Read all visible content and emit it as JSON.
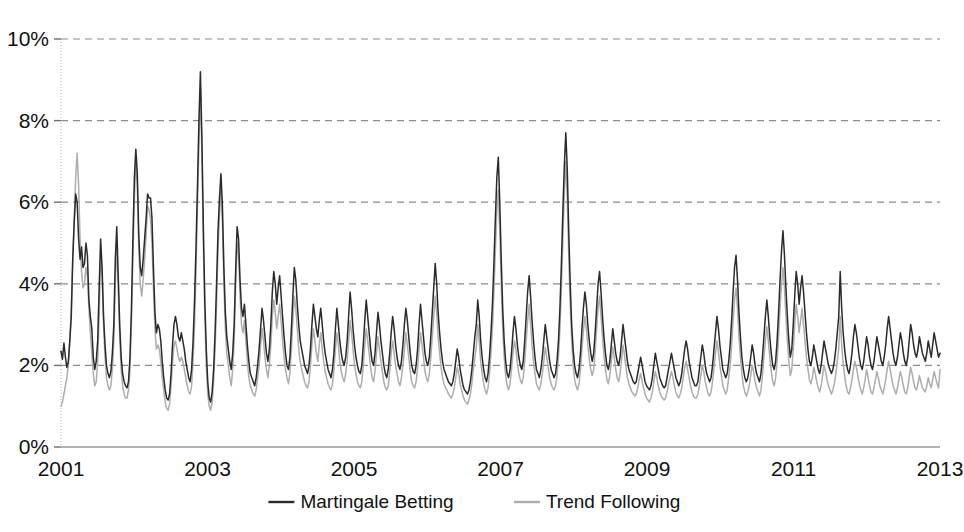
{
  "chart_data": {
    "type": "line",
    "title": "",
    "xlabel": "",
    "ylabel": "",
    "ylim": [
      0,
      10
    ],
    "xlim": [
      2001,
      2013
    ],
    "y_tick_labels": [
      "0%",
      "2%",
      "4%",
      "6%",
      "8%",
      "10%"
    ],
    "y_tick_values": [
      0,
      2,
      4,
      6,
      8,
      10
    ],
    "x_tick_labels": [
      "2001",
      "2003",
      "2005",
      "2007",
      "2009",
      "2011",
      "2013"
    ],
    "x_tick_values": [
      2001,
      2003,
      2005,
      2007,
      2009,
      2011,
      2013
    ],
    "grid": "horizontal-dashed",
    "legend_position": "bottom-center",
    "value_unit": "percent",
    "x_unit": "year",
    "sampling": "weekly",
    "series": [
      {
        "name": "Martingale Betting",
        "color": "#2b2b2b",
        "line_style": "solid",
        "line_width": 1.5,
        "values": [
          2.35,
          2.15,
          2.55,
          2.2,
          1.95,
          2.1,
          2.6,
          3.2,
          4.6,
          5.5,
          6.2,
          6.0,
          5.1,
          4.6,
          4.9,
          4.4,
          4.5,
          5.0,
          4.7,
          3.6,
          3.2,
          2.9,
          2.2,
          1.9,
          2.1,
          2.6,
          3.9,
          5.1,
          4.4,
          3.2,
          2.5,
          2.0,
          1.8,
          1.7,
          1.85,
          2.3,
          3.0,
          4.6,
          5.4,
          4.2,
          3.0,
          2.2,
          1.8,
          1.6,
          1.5,
          1.45,
          1.6,
          2.2,
          3.4,
          5.1,
          6.6,
          7.3,
          6.7,
          5.2,
          4.4,
          4.2,
          4.6,
          5.1,
          5.6,
          6.2,
          6.1,
          6.1,
          5.6,
          4.4,
          3.3,
          2.8,
          3.0,
          2.9,
          2.6,
          2.1,
          1.7,
          1.4,
          1.2,
          1.15,
          1.3,
          1.8,
          2.5,
          3.0,
          3.2,
          3.0,
          2.7,
          2.6,
          2.8,
          2.6,
          2.4,
          2.1,
          1.9,
          1.7,
          1.6,
          1.9,
          2.6,
          3.6,
          4.9,
          6.4,
          8.0,
          9.2,
          7.6,
          5.4,
          3.6,
          2.4,
          1.6,
          1.2,
          1.1,
          1.35,
          1.9,
          2.8,
          4.0,
          5.3,
          6.1,
          6.7,
          5.9,
          4.4,
          3.3,
          2.7,
          2.4,
          2.1,
          1.9,
          2.3,
          3.0,
          4.3,
          5.4,
          5.1,
          4.1,
          3.4,
          3.2,
          3.5,
          3.0,
          2.5,
          2.1,
          1.8,
          1.7,
          1.6,
          1.5,
          1.7,
          2.0,
          2.4,
          2.9,
          3.4,
          3.1,
          2.7,
          2.3,
          2.1,
          2.4,
          3.0,
          3.8,
          4.3,
          4.0,
          3.5,
          3.9,
          4.2,
          3.7,
          3.2,
          2.7,
          2.3,
          2.0,
          1.9,
          2.2,
          2.9,
          3.7,
          4.4,
          4.1,
          3.5,
          3.0,
          2.6,
          2.4,
          2.2,
          2.0,
          1.9,
          1.8,
          2.0,
          2.4,
          3.0,
          3.5,
          3.2,
          2.9,
          2.7,
          3.1,
          3.4,
          3.0,
          2.6,
          2.3,
          2.1,
          1.9,
          1.8,
          1.7,
          1.9,
          2.3,
          2.9,
          3.4,
          3.0,
          2.6,
          2.3,
          2.1,
          2.0,
          2.2,
          2.6,
          3.2,
          3.8,
          3.4,
          2.9,
          2.5,
          2.2,
          2.0,
          1.85,
          1.8,
          2.0,
          2.5,
          3.1,
          3.6,
          3.2,
          2.8,
          2.4,
          2.1,
          2.0,
          2.3,
          2.8,
          3.3,
          3.0,
          2.6,
          2.3,
          2.0,
          1.8,
          1.7,
          1.9,
          2.3,
          2.8,
          3.2,
          2.9,
          2.5,
          2.2,
          2.0,
          1.9,
          2.1,
          2.5,
          3.0,
          3.4,
          3.1,
          2.7,
          2.3,
          2.0,
          1.85,
          1.8,
          2.0,
          2.4,
          3.0,
          3.5,
          3.1,
          2.7,
          2.3,
          2.1,
          2.0,
          2.2,
          2.7,
          3.3,
          3.9,
          4.5,
          4.0,
          3.3,
          2.8,
          2.4,
          2.1,
          1.9,
          1.8,
          1.7,
          1.6,
          1.55,
          1.5,
          1.6,
          1.8,
          2.1,
          2.4,
          2.2,
          1.9,
          1.7,
          1.5,
          1.4,
          1.35,
          1.3,
          1.4,
          1.6,
          1.9,
          2.3,
          2.7,
          3.0,
          3.6,
          3.2,
          2.6,
          2.2,
          1.9,
          1.7,
          1.6,
          1.8,
          2.2,
          2.8,
          3.5,
          4.5,
          5.6,
          6.6,
          7.1,
          6.0,
          4.6,
          3.4,
          2.6,
          2.1,
          1.8,
          1.7,
          1.9,
          2.3,
          2.8,
          3.2,
          2.9,
          2.5,
          2.2,
          2.0,
          1.9,
          2.1,
          2.6,
          3.2,
          3.8,
          4.2,
          3.7,
          3.1,
          2.6,
          2.2,
          1.9,
          1.8,
          1.7,
          1.9,
          2.2,
          2.6,
          3.0,
          2.7,
          2.4,
          2.1,
          1.9,
          1.8,
          1.7,
          1.8,
          2.1,
          2.6,
          3.4,
          4.5,
          5.8,
          6.9,
          7.7,
          6.8,
          5.3,
          4.0,
          3.0,
          2.4,
          2.0,
          1.8,
          1.7,
          1.9,
          2.3,
          2.9,
          3.4,
          3.8,
          3.5,
          3.0,
          2.6,
          2.3,
          2.1,
          2.3,
          2.8,
          3.4,
          4.0,
          4.3,
          3.8,
          3.2,
          2.7,
          2.3,
          2.0,
          1.9,
          2.1,
          2.5,
          2.9,
          2.6,
          2.3,
          2.1,
          2.0,
          2.2,
          2.6,
          3.0,
          2.7,
          2.4,
          2.1,
          1.9,
          1.8,
          1.7,
          1.6,
          1.55,
          1.6,
          1.8,
          2.0,
          2.2,
          2.0,
          1.8,
          1.6,
          1.5,
          1.45,
          1.4,
          1.5,
          1.7,
          2.0,
          2.3,
          2.1,
          1.9,
          1.7,
          1.6,
          1.5,
          1.45,
          1.5,
          1.7,
          1.9,
          2.1,
          2.3,
          2.1,
          1.9,
          1.7,
          1.6,
          1.5,
          1.6,
          1.8,
          2.1,
          2.4,
          2.6,
          2.4,
          2.1,
          1.9,
          1.7,
          1.6,
          1.5,
          1.5,
          1.6,
          1.9,
          2.2,
          2.5,
          2.3,
          2.0,
          1.8,
          1.7,
          1.6,
          1.7,
          2.0,
          2.4,
          2.8,
          3.2,
          2.9,
          2.5,
          2.2,
          1.9,
          1.8,
          1.7,
          1.8,
          2.1,
          2.5,
          3.1,
          3.8,
          4.4,
          4.7,
          4.1,
          3.3,
          2.7,
          2.2,
          1.9,
          1.7,
          1.6,
          1.7,
          1.9,
          2.2,
          2.5,
          2.3,
          2.0,
          1.8,
          1.7,
          1.6,
          1.8,
          2.2,
          2.7,
          3.2,
          3.6,
          3.2,
          2.7,
          2.3,
          2.0,
          1.9,
          2.1,
          2.6,
          3.3,
          4.1,
          4.8,
          5.3,
          4.7,
          3.9,
          3.2,
          2.6,
          2.2,
          2.4,
          3.0,
          3.7,
          4.3,
          4.0,
          3.5,
          3.9,
          4.2,
          3.8,
          3.3,
          2.8,
          2.4,
          2.1,
          2.0,
          2.2,
          2.5,
          2.3,
          2.1,
          1.9,
          1.8,
          2.0,
          2.3,
          2.6,
          2.4,
          2.2,
          2.0,
          1.9,
          1.8,
          1.9,
          2.1,
          2.4,
          2.8,
          3.2,
          4.3,
          3.4,
          2.8,
          2.4,
          2.1,
          1.9,
          1.8,
          2.0,
          2.3,
          2.7,
          3.0,
          2.8,
          2.5,
          2.2,
          2.0,
          1.9,
          2.1,
          2.4,
          2.7,
          2.5,
          2.2,
          2.0,
          1.9,
          2.1,
          2.4,
          2.7,
          2.5,
          2.3,
          2.1,
          2.0,
          2.2,
          2.5,
          2.9,
          3.2,
          2.9,
          2.6,
          2.3,
          2.1,
          2.0,
          2.2,
          2.5,
          2.8,
          2.6,
          2.3,
          2.1,
          2.0,
          2.2,
          2.6,
          3.0,
          2.8,
          2.5,
          2.3,
          2.2,
          2.4,
          2.7,
          2.5,
          2.3,
          2.2,
          2.1,
          2.3,
          2.6,
          2.4,
          2.2,
          2.5,
          2.8,
          2.6,
          2.4,
          2.2,
          2.3
        ]
      },
      {
        "name": "Trend Following",
        "color": "#adadad",
        "line_style": "solid",
        "line_width": 1.5,
        "values": [
          1.0,
          1.1,
          1.3,
          1.5,
          1.7,
          2.0,
          2.6,
          3.4,
          4.6,
          5.6,
          6.6,
          7.2,
          6.4,
          5.1,
          4.3,
          3.9,
          4.0,
          4.4,
          4.2,
          3.4,
          2.8,
          2.3,
          1.8,
          1.5,
          1.6,
          2.1,
          3.2,
          4.7,
          4.2,
          3.0,
          2.2,
          1.7,
          1.5,
          1.4,
          1.5,
          1.9,
          2.6,
          4.0,
          5.0,
          3.9,
          2.7,
          1.9,
          1.5,
          1.3,
          1.2,
          1.2,
          1.4,
          1.9,
          3.0,
          4.6,
          6.1,
          7.0,
          6.4,
          4.9,
          4.0,
          3.7,
          4.1,
          4.6,
          5.2,
          5.9,
          5.8,
          5.6,
          5.0,
          3.9,
          2.9,
          2.4,
          2.5,
          2.4,
          2.1,
          1.7,
          1.4,
          1.1,
          0.95,
          0.9,
          1.05,
          1.5,
          2.1,
          2.5,
          2.6,
          2.4,
          2.2,
          2.1,
          2.2,
          2.1,
          1.9,
          1.7,
          1.5,
          1.35,
          1.3,
          1.5,
          2.1,
          3.0,
          4.3,
          5.9,
          7.4,
          8.8,
          7.2,
          5.0,
          3.2,
          2.0,
          1.3,
          1.0,
          0.9,
          1.1,
          1.6,
          2.4,
          3.5,
          4.8,
          5.7,
          6.3,
          5.5,
          4.0,
          2.9,
          2.3,
          2.0,
          1.7,
          1.5,
          1.9,
          2.6,
          3.9,
          5.0,
          4.7,
          3.7,
          3.0,
          2.8,
          3.1,
          2.6,
          2.1,
          1.7,
          1.5,
          1.4,
          1.3,
          1.25,
          1.4,
          1.7,
          2.0,
          2.5,
          2.9,
          2.6,
          2.2,
          1.9,
          1.7,
          2.0,
          2.5,
          3.2,
          3.6,
          3.3,
          2.9,
          3.2,
          3.5,
          3.1,
          2.6,
          2.2,
          1.9,
          1.7,
          1.55,
          1.8,
          2.4,
          3.1,
          3.7,
          3.4,
          2.9,
          2.4,
          2.1,
          1.9,
          1.75,
          1.6,
          1.5,
          1.45,
          1.6,
          2.0,
          2.5,
          2.9,
          2.6,
          2.3,
          2.1,
          2.5,
          2.8,
          2.4,
          2.1,
          1.85,
          1.7,
          1.55,
          1.45,
          1.4,
          1.55,
          1.9,
          2.4,
          2.8,
          2.5,
          2.1,
          1.85,
          1.7,
          1.6,
          1.8,
          2.1,
          2.6,
          3.1,
          2.8,
          2.4,
          2.0,
          1.8,
          1.6,
          1.5,
          1.45,
          1.6,
          2.0,
          2.5,
          2.9,
          2.6,
          2.3,
          1.95,
          1.7,
          1.6,
          1.85,
          2.3,
          2.7,
          2.4,
          2.1,
          1.85,
          1.6,
          1.45,
          1.4,
          1.5,
          1.85,
          2.3,
          2.6,
          2.3,
          2.0,
          1.8,
          1.6,
          1.5,
          1.7,
          2.0,
          2.4,
          2.8,
          2.5,
          2.2,
          1.85,
          1.6,
          1.5,
          1.45,
          1.6,
          1.95,
          2.4,
          2.8,
          2.5,
          2.2,
          1.85,
          1.7,
          1.6,
          1.8,
          2.2,
          2.7,
          3.2,
          3.7,
          3.3,
          2.7,
          2.3,
          1.95,
          1.7,
          1.55,
          1.45,
          1.4,
          1.3,
          1.25,
          1.2,
          1.3,
          1.45,
          1.7,
          1.95,
          1.8,
          1.55,
          1.4,
          1.25,
          1.15,
          1.1,
          1.05,
          1.15,
          1.3,
          1.55,
          1.9,
          2.2,
          2.45,
          3.0,
          2.6,
          2.1,
          1.8,
          1.55,
          1.4,
          1.3,
          1.45,
          1.8,
          2.3,
          2.9,
          3.8,
          4.8,
          5.8,
          6.3,
          5.3,
          4.0,
          2.9,
          2.2,
          1.75,
          1.5,
          1.4,
          1.55,
          1.9,
          2.3,
          2.6,
          2.4,
          2.05,
          1.8,
          1.65,
          1.55,
          1.7,
          2.1,
          2.6,
          3.1,
          3.5,
          3.0,
          2.5,
          2.1,
          1.8,
          1.55,
          1.45,
          1.4,
          1.55,
          1.8,
          2.1,
          2.45,
          2.2,
          1.95,
          1.7,
          1.55,
          1.45,
          1.4,
          1.5,
          1.75,
          2.2,
          2.9,
          3.9,
          5.1,
          6.2,
          7.0,
          6.1,
          4.7,
          3.5,
          2.6,
          2.0,
          1.65,
          1.5,
          1.4,
          1.55,
          1.9,
          2.4,
          2.85,
          3.2,
          2.9,
          2.5,
          2.15,
          1.9,
          1.75,
          1.9,
          2.35,
          2.9,
          3.4,
          3.7,
          3.2,
          2.7,
          2.25,
          1.9,
          1.65,
          1.55,
          1.75,
          2.1,
          2.45,
          2.2,
          1.9,
          1.7,
          1.6,
          1.8,
          2.15,
          2.5,
          2.25,
          1.95,
          1.7,
          1.55,
          1.45,
          1.35,
          1.3,
          1.25,
          1.3,
          1.45,
          1.65,
          1.8,
          1.6,
          1.45,
          1.3,
          1.2,
          1.15,
          1.1,
          1.2,
          1.35,
          1.6,
          1.85,
          1.7,
          1.5,
          1.35,
          1.25,
          1.2,
          1.15,
          1.2,
          1.35,
          1.55,
          1.7,
          1.85,
          1.7,
          1.5,
          1.35,
          1.25,
          1.2,
          1.3,
          1.45,
          1.7,
          1.95,
          2.1,
          1.9,
          1.7,
          1.5,
          1.35,
          1.25,
          1.2,
          1.2,
          1.3,
          1.5,
          1.75,
          2.0,
          1.85,
          1.6,
          1.45,
          1.3,
          1.25,
          1.35,
          1.6,
          1.95,
          2.3,
          2.6,
          2.35,
          2.0,
          1.75,
          1.5,
          1.4,
          1.3,
          1.4,
          1.7,
          2.0,
          2.5,
          3.1,
          3.6,
          3.9,
          3.4,
          2.7,
          2.2,
          1.8,
          1.5,
          1.35,
          1.25,
          1.35,
          1.5,
          1.75,
          2.0,
          1.85,
          1.6,
          1.45,
          1.35,
          1.25,
          1.4,
          1.75,
          2.2,
          2.6,
          2.95,
          2.6,
          2.2,
          1.85,
          1.6,
          1.5,
          1.7,
          2.1,
          2.7,
          3.4,
          4.0,
          4.4,
          3.9,
          3.2,
          2.6,
          2.1,
          1.75,
          1.9,
          2.4,
          3.0,
          3.5,
          3.2,
          2.8,
          3.1,
          3.4,
          3.0,
          2.6,
          2.2,
          1.9,
          1.65,
          1.55,
          1.7,
          1.95,
          1.8,
          1.6,
          1.45,
          1.35,
          1.5,
          1.75,
          2.0,
          1.85,
          1.65,
          1.5,
          1.4,
          1.3,
          1.4,
          1.55,
          1.8,
          2.1,
          2.4,
          3.2,
          2.5,
          2.05,
          1.75,
          1.5,
          1.35,
          1.3,
          1.45,
          1.65,
          1.9,
          2.1,
          1.95,
          1.75,
          1.55,
          1.4,
          1.3,
          1.45,
          1.65,
          1.9,
          1.7,
          1.5,
          1.35,
          1.3,
          1.45,
          1.65,
          1.85,
          1.7,
          1.5,
          1.4,
          1.3,
          1.45,
          1.65,
          1.9,
          2.1,
          1.9,
          1.7,
          1.5,
          1.4,
          1.3,
          1.45,
          1.65,
          1.85,
          1.7,
          1.5,
          1.35,
          1.3,
          1.45,
          1.7,
          1.95,
          1.8,
          1.6,
          1.45,
          1.4,
          1.55,
          1.75,
          1.6,
          1.45,
          1.4,
          1.35,
          1.5,
          1.7,
          1.55,
          1.45,
          1.65,
          1.85,
          1.7,
          1.55,
          1.45,
          1.9
        ]
      }
    ]
  },
  "legend": {
    "items": [
      {
        "label": "Martingale Betting",
        "color": "#2b2b2b",
        "style": "solid"
      },
      {
        "label": "Trend Following",
        "color": "#adadad",
        "style": "solid"
      }
    ]
  },
  "colors": {
    "background": "#ffffff",
    "grid": "#8c8c8c",
    "axis": "#9a9a9a",
    "text": "#111111",
    "series_primary": "#2b2b2b",
    "series_secondary": "#adadad"
  }
}
